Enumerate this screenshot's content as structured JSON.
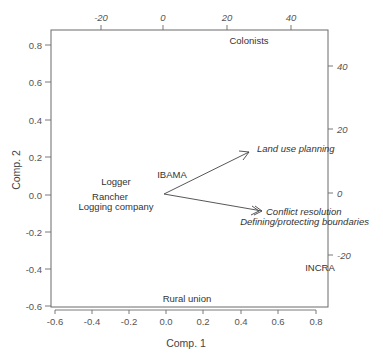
{
  "chart_data": {
    "type": "scatter",
    "subtype": "biplot",
    "title": "",
    "xlabel": "Comp. 1",
    "ylabel": "Comp. 2",
    "xlim": [
      -0.62,
      0.88
    ],
    "ylim": [
      -0.6,
      0.88
    ],
    "x_ticks": [
      "-0.6",
      "-0.4",
      "-0.2",
      "0.0",
      "0.2",
      "0.4",
      "0.6",
      "0.8"
    ],
    "y_ticks": [
      "-0.6",
      "-0.4",
      "-0.2",
      "0.0",
      "0.2",
      "0.4",
      "0.6",
      "0.8"
    ],
    "secondary_x_ticks": [
      "-20",
      "0",
      "20",
      "40"
    ],
    "secondary_y_ticks": [
      "-20",
      "0",
      "20",
      "40"
    ],
    "grid": false,
    "legend": "none",
    "points": [
      {
        "label": "Colonists",
        "x": 0.45,
        "y": 0.82
      },
      {
        "label": "Logger",
        "x": -0.26,
        "y": 0.07
      },
      {
        "label": "Rancher",
        "x": -0.3,
        "y": -0.01
      },
      {
        "label": "Logging company",
        "x": -0.26,
        "y": -0.06
      },
      {
        "label": "IBAMA",
        "x": 0.04,
        "y": 0.11
      },
      {
        "label": "INCRA",
        "x": 0.83,
        "y": -0.39
      },
      {
        "label": "Rural union",
        "x": 0.12,
        "y": -0.56
      }
    ],
    "vectors": [
      {
        "label": "Land use planning",
        "x": 13,
        "y": 13
      },
      {
        "label": "Conflict resolution",
        "x": 15,
        "y": -5
      },
      {
        "label": "Defining/protecting boundaries",
        "x": 15,
        "y": -5
      }
    ]
  },
  "axes": {
    "xlabel": "Comp. 1",
    "ylabel": "Comp. 2",
    "bottom_ticks": [
      {
        "label": "-0.6",
        "px": 55
      },
      {
        "label": "-0.4",
        "px": 92
      },
      {
        "label": "-0.2",
        "px": 129
      },
      {
        "label": "0.0",
        "px": 166
      },
      {
        "label": "0.2",
        "px": 203
      },
      {
        "label": "0.4",
        "px": 241
      },
      {
        "label": "0.6",
        "px": 278
      },
      {
        "label": "0.8",
        "px": 316
      }
    ],
    "left_ticks": [
      {
        "label": "0.8",
        "py": 45
      },
      {
        "label": "0.6",
        "py": 82
      },
      {
        "label": "0.4",
        "py": 120
      },
      {
        "label": "0.2",
        "py": 157
      },
      {
        "label": "0.0",
        "py": 195
      },
      {
        "label": "-0.2",
        "py": 232
      },
      {
        "label": "-0.4",
        "py": 269
      },
      {
        "label": "-0.6",
        "py": 306
      }
    ],
    "top_ticks": [
      {
        "label": "-20",
        "px": 101
      },
      {
        "label": "0",
        "px": 163
      },
      {
        "label": "20",
        "px": 227
      },
      {
        "label": "40",
        "px": 291
      }
    ],
    "right_ticks": [
      {
        "label": "40",
        "py": 66
      },
      {
        "label": "20",
        "py": 129
      },
      {
        "label": "0",
        "py": 193
      },
      {
        "label": "-20",
        "py": 255
      }
    ]
  },
  "labels": {
    "colonists": "Colonists",
    "logger": "Logger",
    "rancher": "Rancher",
    "logging_company": "Logging company",
    "ibama": "IBAMA",
    "incra": "INCRA",
    "rural_union": "Rural union",
    "land_use_planning": "Land use planning",
    "conflict_resolution": "Conflict resolution",
    "defining_boundaries": "Defining/protecting boundaries"
  },
  "colors": {
    "frame": "#6b6b6b",
    "text": "#333333",
    "tick_text": "#555555",
    "arrow": "#444444"
  }
}
